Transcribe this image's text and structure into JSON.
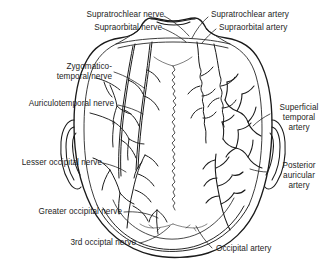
{
  "figure": {
    "view": "superior view of skull with scalp nerves on left and arteries on right",
    "stroke_color": "#1a1a1a",
    "text_color": "#1d1d1d",
    "background": "#ffffff"
  },
  "labels": {
    "supratrochlear_nerve": "Supratrochlear nerve",
    "supraorbital_nerve": "Supraorbital nerve",
    "supratrochlear_artery": "Supratrochlear artery",
    "supraorbital_artery": "Supraorbital artery",
    "zygomaticotemporal_nerve_line1": "Zygomatico-",
    "zygomaticotemporal_nerve_line2": "temporal nerve",
    "auriculotemporal_nerve": "Auriculotemporal nerve",
    "superficial_temporal_artery_line1": "Superficial",
    "superficial_temporal_artery_line2": "temporal",
    "superficial_temporal_artery_line3": "artery",
    "lesser_occipital_nerve": "Lesser occipital nerve",
    "posterior_auricular_artery_line1": "Posterior",
    "posterior_auricular_artery_line2": "auricular",
    "posterior_auricular_artery_line3": "artery",
    "greater_occipital_nerve": "Greater occipital nerve",
    "third_occipital_nerve": "3rd occiptal nerve",
    "occipital_artery": "Occipital artery"
  },
  "structures": {
    "nerves": [
      "Supratrochlear nerve",
      "Supraorbital nerve",
      "Zygomatico-temporal nerve",
      "Auriculotemporal nerve",
      "Lesser occipital nerve",
      "Greater occipital nerve",
      "3rd occiptal nerve"
    ],
    "arteries": [
      "Supratrochlear artery",
      "Supraorbital artery",
      "Superficial temporal artery",
      "Posterior auricular artery",
      "Occipital artery"
    ],
    "outline_features": [
      "head outline",
      "nose",
      "left ear",
      "right ear",
      "sagittal suture",
      "lambdoid suture"
    ]
  }
}
